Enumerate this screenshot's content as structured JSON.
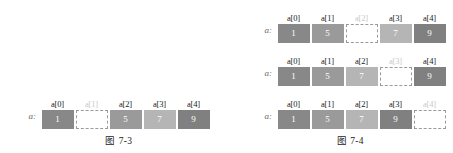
{
  "figures": [
    {
      "id": "figure-7-3",
      "caption": "图 7-3",
      "rows": [
        {
          "pointer_label": "a:",
          "cells": [
            {
              "label": "a[0]",
              "value": "1",
              "empty": false,
              "label_dim": false,
              "color": "#888888"
            },
            {
              "label": "a[1]",
              "value": "",
              "empty": true,
              "label_dim": true,
              "color": "#ffffff"
            },
            {
              "label": "a[2]",
              "value": "5",
              "empty": false,
              "label_dim": false,
              "color": "#9a9a9a"
            },
            {
              "label": "a[3]",
              "value": "7",
              "empty": false,
              "label_dim": false,
              "color": "#b5b5b5"
            },
            {
              "label": "a[4]",
              "value": "9",
              "empty": false,
              "label_dim": false,
              "color": "#808080"
            }
          ]
        }
      ]
    },
    {
      "id": "figure-7-4",
      "caption": "图 7-4",
      "rows": [
        {
          "pointer_label": "a:",
          "cells": [
            {
              "label": "a[0]",
              "value": "1",
              "empty": false,
              "label_dim": false,
              "color": "#888888"
            },
            {
              "label": "a[1]",
              "value": "5",
              "empty": false,
              "label_dim": false,
              "color": "#9a9a9a"
            },
            {
              "label": "a[2]",
              "value": "",
              "empty": true,
              "label_dim": true,
              "color": "#ffffff"
            },
            {
              "label": "a[3]",
              "value": "7",
              "empty": false,
              "label_dim": false,
              "color": "#b5b5b5"
            },
            {
              "label": "a[4]",
              "value": "9",
              "empty": false,
              "label_dim": false,
              "color": "#808080"
            }
          ]
        },
        {
          "pointer_label": "a:",
          "cells": [
            {
              "label": "a[0]",
              "value": "1",
              "empty": false,
              "label_dim": false,
              "color": "#888888"
            },
            {
              "label": "a[1]",
              "value": "5",
              "empty": false,
              "label_dim": false,
              "color": "#9a9a9a"
            },
            {
              "label": "a[2]",
              "value": "7",
              "empty": false,
              "label_dim": false,
              "color": "#b5b5b5"
            },
            {
              "label": "a[3]",
              "value": "",
              "empty": true,
              "label_dim": true,
              "color": "#ffffff"
            },
            {
              "label": "a[4]",
              "value": "9",
              "empty": false,
              "label_dim": false,
              "color": "#808080"
            }
          ]
        },
        {
          "pointer_label": "a:",
          "cells": [
            {
              "label": "a[0]",
              "value": "1",
              "empty": false,
              "label_dim": false,
              "color": "#888888"
            },
            {
              "label": "a[1]",
              "value": "5",
              "empty": false,
              "label_dim": false,
              "color": "#9a9a9a"
            },
            {
              "label": "a[2]",
              "value": "7",
              "empty": false,
              "label_dim": false,
              "color": "#b5b5b5"
            },
            {
              "label": "a[3]",
              "value": "9",
              "empty": false,
              "label_dim": false,
              "color": "#808080"
            },
            {
              "label": "a[4]",
              "value": "",
              "empty": true,
              "label_dim": true,
              "color": "#ffffff"
            }
          ]
        }
      ]
    }
  ]
}
